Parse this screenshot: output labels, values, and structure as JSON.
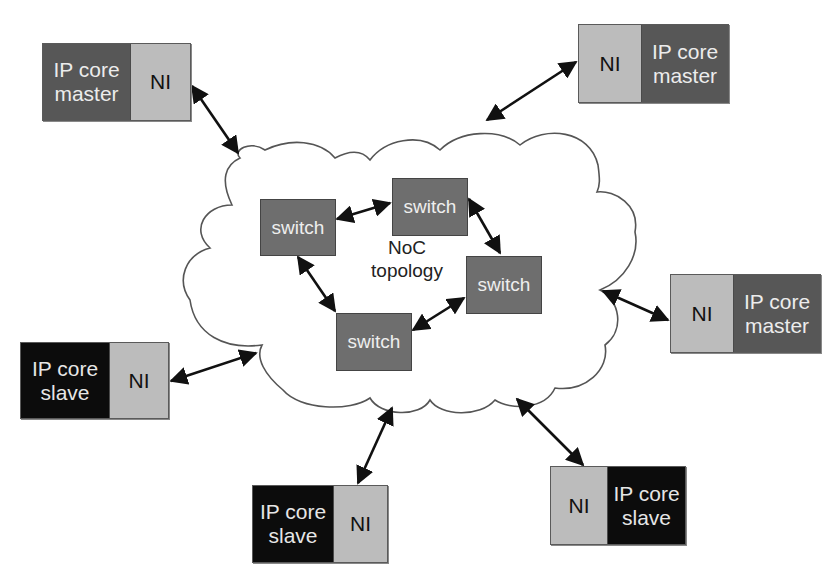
{
  "diagram": {
    "title": "",
    "cloud": {
      "label_line1": "NoC",
      "label_line2": "topology"
    },
    "switches": [
      {
        "id": "sw-left",
        "label": "switch"
      },
      {
        "id": "sw-top",
        "label": "switch"
      },
      {
        "id": "sw-right",
        "label": "switch"
      },
      {
        "id": "sw-bottom",
        "label": "switch"
      }
    ],
    "nodes": [
      {
        "id": "top-left",
        "ip_label_line1": "IP core",
        "ip_label_line2": "master",
        "ni_label": "NI",
        "role": "master"
      },
      {
        "id": "top-right",
        "ip_label_line1": "IP core",
        "ip_label_line2": "master",
        "ni_label": "NI",
        "role": "master"
      },
      {
        "id": "right",
        "ip_label_line1": "IP core",
        "ip_label_line2": "master",
        "ni_label": "NI",
        "role": "master"
      },
      {
        "id": "left",
        "ip_label_line1": "IP core",
        "ip_label_line2": "slave",
        "ni_label": "NI",
        "role": "slave"
      },
      {
        "id": "bottom",
        "ip_label_line1": "IP core",
        "ip_label_line2": "slave",
        "ni_label": "NI",
        "role": "slave"
      },
      {
        "id": "bottom-right",
        "ip_label_line1": "IP core",
        "ip_label_line2": "slave",
        "ni_label": "NI",
        "role": "slave"
      }
    ],
    "edges": [
      {
        "from": "sw-left",
        "to": "sw-top",
        "type": "bidirectional"
      },
      {
        "from": "sw-top",
        "to": "sw-right",
        "type": "bidirectional"
      },
      {
        "from": "sw-right",
        "to": "sw-bottom",
        "type": "bidirectional"
      },
      {
        "from": "sw-bottom",
        "to": "sw-left",
        "type": "bidirectional"
      },
      {
        "from": "top-left",
        "to": "cloud",
        "type": "bidirectional"
      },
      {
        "from": "top-right",
        "to": "cloud",
        "type": "bidirectional"
      },
      {
        "from": "right",
        "to": "cloud",
        "type": "bidirectional"
      },
      {
        "from": "left",
        "to": "cloud",
        "type": "bidirectional"
      },
      {
        "from": "bottom",
        "to": "cloud",
        "type": "bidirectional"
      },
      {
        "from": "bottom-right",
        "to": "cloud",
        "type": "bidirectional"
      }
    ],
    "colors": {
      "ni_fill": "#bcbcbc",
      "ip_master_fill": "#575757",
      "ip_slave_fill": "#0c0c0c",
      "switch_fill": "#6e6e6e",
      "cloud_stroke": "#555555",
      "arrow": "#111111"
    }
  }
}
